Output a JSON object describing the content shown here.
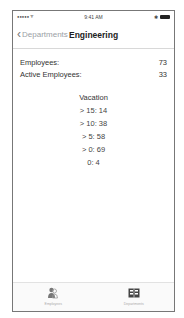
{
  "status_bar": {
    "signal": "●●●●● ᯤ",
    "time": "9:41 AM",
    "bluetooth": "✱"
  },
  "navbar": {
    "back_label": "Departments",
    "title": "Engineering"
  },
  "stats": [
    {
      "label": "Employees:",
      "value": "73"
    },
    {
      "label": "Active Employees:",
      "value": "33"
    }
  ],
  "vacation": {
    "heading": "Vacation",
    "items": [
      "> 15: 14",
      "> 10: 38",
      "> 5: 58",
      "> 0: 69",
      "0: 4"
    ]
  },
  "tabbar": {
    "tabs": [
      {
        "label": "Employees",
        "icon": "employees-icon"
      },
      {
        "label": "Departments",
        "icon": "departments-icon"
      }
    ]
  }
}
